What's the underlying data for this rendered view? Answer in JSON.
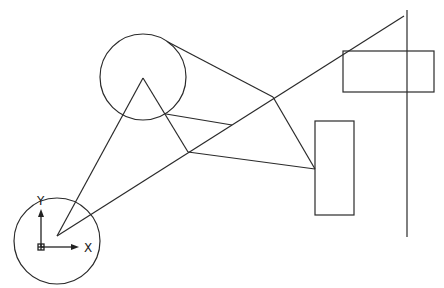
{
  "drawing": {
    "background": "#ffffff",
    "stroke_color": "#2a2a2a",
    "circles": [
      {
        "name": "large-circle",
        "cx": 143,
        "cy": 77,
        "r": 43
      },
      {
        "name": "origin-circle",
        "cx": 57,
        "cy": 241,
        "r": 43
      }
    ],
    "lines": [
      {
        "name": "triangle-left-edge",
        "x1": 57,
        "y1": 236,
        "x2": 143,
        "y2": 78
      },
      {
        "name": "triangle-right-edge",
        "x1": 143,
        "y1": 78,
        "x2": 188,
        "y2": 152
      },
      {
        "name": "tangent-line",
        "x1": 168,
        "y1": 42,
        "x2": 273,
        "y2": 97
      },
      {
        "name": "circle-to-diagonal",
        "x1": 166,
        "y1": 114,
        "x2": 232,
        "y2": 125
      },
      {
        "name": "long-diagonal",
        "x1": 57,
        "y1": 236,
        "x2": 404,
        "y2": 16
      },
      {
        "name": "node-to-rect",
        "x1": 188,
        "y1": 152,
        "x2": 315,
        "y2": 169
      },
      {
        "name": "apex-to-rect",
        "x1": 273,
        "y1": 97,
        "x2": 315,
        "y2": 169
      },
      {
        "name": "vertical-line",
        "x1": 407,
        "y1": 10,
        "x2": 407,
        "y2": 237
      }
    ],
    "rectangles": [
      {
        "name": "upper-right-rectangle",
        "x": 343,
        "y": 51,
        "w": 91,
        "h": 41
      },
      {
        "name": "lower-rectangle",
        "x": 315,
        "y": 121,
        "w": 39,
        "h": 94
      }
    ],
    "ucs_icon": {
      "origin_x": 41,
      "origin_y": 247,
      "x_label": "X",
      "y_label": "Y"
    }
  }
}
